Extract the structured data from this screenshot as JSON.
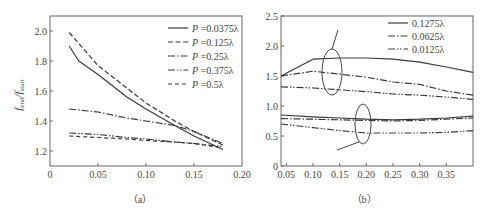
{
  "chart_data": [
    {
      "id": "a",
      "type": "line",
      "caption": "(a)",
      "title": "",
      "xlabel": "",
      "ylabel": "f_end / f_start",
      "xlim": [
        0,
        0.2
      ],
      "ylim": [
        1.1,
        2.1
      ],
      "xticks": [
        "0",
        "0.05",
        "0.10",
        "0.15",
        "0.20"
      ],
      "yticks": [
        "1.2",
        "1.4",
        "1.6",
        "1.8",
        "2.0"
      ],
      "grid": false,
      "legend_position": "upper right",
      "series": [
        {
          "name": "P=0.0375λ",
          "style": "solid",
          "x": [
            0.02,
            0.03,
            0.05,
            0.08,
            0.1,
            0.13,
            0.15,
            0.18
          ],
          "y": [
            1.9,
            1.8,
            1.71,
            1.56,
            1.48,
            1.37,
            1.3,
            1.21
          ]
        },
        {
          "name": "P=0.125λ",
          "style": "dashed",
          "x": [
            0.02,
            0.05,
            0.08,
            0.1,
            0.13,
            0.15,
            0.18
          ],
          "y": [
            1.99,
            1.77,
            1.62,
            1.52,
            1.4,
            1.33,
            1.24
          ]
        },
        {
          "name": "P=0.25λ",
          "style": "dashdot",
          "x": [
            0.02,
            0.05,
            0.08,
            0.1,
            0.13,
            0.15,
            0.18
          ],
          "y": [
            1.48,
            1.46,
            1.42,
            1.4,
            1.37,
            1.33,
            1.25
          ]
        },
        {
          "name": "P=0.375λ",
          "style": "dashdotdot",
          "x": [
            0.02,
            0.05,
            0.08,
            0.1,
            0.13,
            0.15,
            0.18
          ],
          "y": [
            1.32,
            1.31,
            1.29,
            1.28,
            1.26,
            1.25,
            1.23
          ]
        },
        {
          "name": "P=0.5λ",
          "style": "longdash",
          "x": [
            0.02,
            0.05,
            0.08,
            0.1,
            0.13,
            0.15,
            0.18
          ],
          "y": [
            1.3,
            1.29,
            1.28,
            1.27,
            1.26,
            1.25,
            1.22
          ]
        }
      ]
    },
    {
      "id": "b",
      "type": "line",
      "caption": "(b)",
      "title": "",
      "xlabel": "",
      "ylabel": "",
      "xlim": [
        0.04,
        0.4
      ],
      "ylim": [
        0,
        2.5
      ],
      "xticks": [
        "0.05",
        "0.10",
        "0.15",
        "0.20",
        "0.25",
        "0.30",
        "0.35"
      ],
      "yticks": [
        "0",
        "0.5",
        "1.0",
        "1.5",
        "2.0",
        "2.5"
      ],
      "grid": false,
      "legend_position": "upper right",
      "annotations": [
        "upper ellipse group (three curves around 1.2–1.8)",
        "lower ellipse group (three curves around 0.55–0.85)"
      ],
      "series": [
        {
          "name": "0.1275λ (upper)",
          "style": "solid",
          "x": [
            0.04,
            0.1,
            0.15,
            0.2,
            0.25,
            0.3,
            0.35,
            0.4
          ],
          "y": [
            1.5,
            1.78,
            1.8,
            1.8,
            1.78,
            1.73,
            1.65,
            1.56
          ]
        },
        {
          "name": "0.0625λ (upper)",
          "style": "dashdot",
          "x": [
            0.04,
            0.1,
            0.15,
            0.2,
            0.25,
            0.3,
            0.35,
            0.4
          ],
          "y": [
            1.5,
            1.58,
            1.53,
            1.48,
            1.4,
            1.36,
            1.25,
            1.18
          ]
        },
        {
          "name": "0.0125λ (upper)",
          "style": "dashdotdot",
          "x": [
            0.04,
            0.1,
            0.15,
            0.2,
            0.25,
            0.3,
            0.35,
            0.4
          ],
          "y": [
            1.32,
            1.3,
            1.27,
            1.24,
            1.2,
            1.18,
            1.15,
            1.11
          ]
        },
        {
          "name": "0.1275λ (lower)",
          "style": "solid",
          "x": [
            0.04,
            0.1,
            0.15,
            0.2,
            0.25,
            0.3,
            0.35,
            0.4
          ],
          "y": [
            0.85,
            0.82,
            0.8,
            0.78,
            0.77,
            0.78,
            0.8,
            0.83
          ]
        },
        {
          "name": "0.0625λ (lower)",
          "style": "dashdot",
          "x": [
            0.04,
            0.1,
            0.15,
            0.2,
            0.25,
            0.3,
            0.35,
            0.4
          ],
          "y": [
            0.79,
            0.78,
            0.77,
            0.76,
            0.75,
            0.76,
            0.78,
            0.8
          ]
        },
        {
          "name": "0.0125λ (lower)",
          "style": "dashdotdot",
          "x": [
            0.04,
            0.1,
            0.15,
            0.2,
            0.25,
            0.3,
            0.35,
            0.4
          ],
          "y": [
            0.7,
            0.64,
            0.59,
            0.55,
            0.55,
            0.55,
            0.56,
            0.59
          ]
        }
      ],
      "legend": [
        {
          "label": "0.1275λ",
          "style": "solid"
        },
        {
          "label": "0.0625λ",
          "style": "dashdot"
        },
        {
          "label": "0.0125λ",
          "style": "dashdotdot"
        }
      ]
    }
  ],
  "labels": {
    "a_ylabel_main": "f",
    "a_ylabel_sub1": "end",
    "a_ylabel_sep": "/",
    "a_ylabel_sub2": "start",
    "a_caption": "（a）",
    "b_caption": "（b）",
    "a_legend": [
      "P =0.0375λ",
      "P =0.125λ",
      "P =0.25λ",
      "P =0.375λ",
      "P =0.5λ"
    ],
    "b_legend": [
      "0.1275λ",
      "0.0625λ",
      "0.0125λ"
    ]
  },
  "colors": {
    "line": "#3a3a3a",
    "axis": "#555555",
    "text": "#444444"
  }
}
